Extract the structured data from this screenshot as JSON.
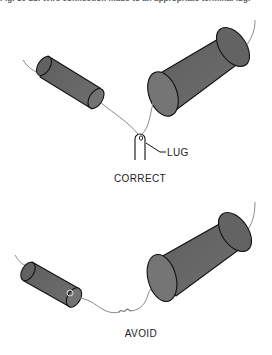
{
  "caption": "Fig. 30-28.  Wire connection made to an appropriate terminal lug.",
  "panels": [
    {
      "id": "correct",
      "title": "CORRECT",
      "callouts": [
        {
          "label": "LUG"
        }
      ],
      "components": [
        "small-cylinder-component",
        "large-cylinder-component",
        "terminal-lug"
      ]
    },
    {
      "id": "avoid",
      "title": "AVOID",
      "components": [
        "small-cylinder-component",
        "large-cylinder-component",
        "twisted-wire-splice"
      ]
    }
  ],
  "colors": {
    "component_fill": "#6b6b6b",
    "component_cap": "#7a7a7a",
    "outline": "#111111",
    "wire": "#8a8a8a",
    "text": "#222222"
  }
}
